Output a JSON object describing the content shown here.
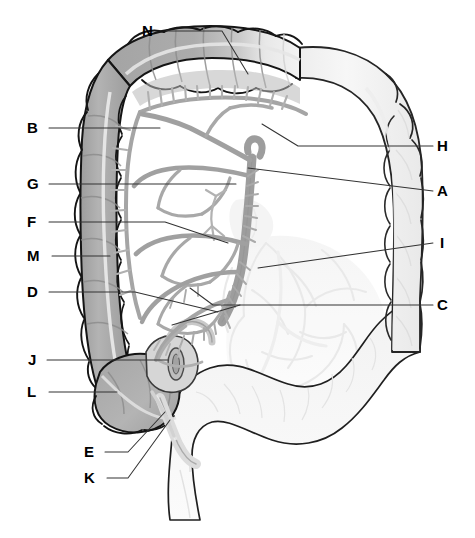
{
  "figure": {
    "background_color": "#ffffff",
    "width": 475,
    "height": 538
  },
  "palette": {
    "outline": "#1a1a1a",
    "near_colon_fill": "#ababab",
    "near_colon_fill_dark": "#9a9a9a",
    "far_colon_fill": "#f1f1f1",
    "far_colon_outline": "#2b2b2b",
    "vessel": "#9d9d9d",
    "vessel_light": "#b5b5b5",
    "ghost_vessel": "#e4e4e4",
    "ghost_organ": "#f2f2f2",
    "leader_line": "#333333",
    "label_text": "#000000",
    "taenia": "#e9e9e9"
  },
  "labels": [
    {
      "id": "N",
      "text": "N",
      "side": "top",
      "x": 142,
      "y": 23,
      "anchor": [
        166,
        31
      ],
      "path": [
        [
          166,
          31
        ],
        [
          222,
          31
        ],
        [
          248,
          74
        ]
      ],
      "target_part": "transverse-colon"
    },
    {
      "id": "B",
      "text": "B",
      "side": "left",
      "x": 27,
      "y": 120,
      "anchor": [
        49,
        128
      ],
      "path": [
        [
          49,
          128
        ],
        [
          160,
          128
        ]
      ],
      "target_part": "middle-colic-artery"
    },
    {
      "id": "H",
      "text": "H",
      "side": "right",
      "x": 437,
      "y": 138,
      "anchor": [
        433,
        146
      ],
      "path": [
        [
          433,
          146
        ],
        [
          298,
          146
        ],
        [
          262,
          124
        ]
      ],
      "target_part": "marginal-artery"
    },
    {
      "id": "G",
      "text": "G",
      "side": "left",
      "x": 27,
      "y": 176,
      "anchor": [
        49,
        184
      ],
      "path": [
        [
          49,
          184
        ],
        [
          236,
          184
        ]
      ],
      "target_part": "jejunal-arteries"
    },
    {
      "id": "A",
      "text": "A",
      "side": "right",
      "x": 437,
      "y": 183,
      "anchor": [
        433,
        191
      ],
      "path": [
        [
          433,
          191
        ],
        [
          248,
          168
        ]
      ],
      "target_part": "superior-mesenteric-artery"
    },
    {
      "id": "F",
      "text": "F",
      "side": "left",
      "x": 27,
      "y": 214,
      "anchor": [
        49,
        222
      ],
      "path": [
        [
          49,
          222
        ],
        [
          165,
          222
        ],
        [
          228,
          243
        ]
      ],
      "target_part": "ileocolic-artery"
    },
    {
      "id": "M",
      "text": "M",
      "side": "left",
      "x": 27,
      "y": 248,
      "anchor": [
        52,
        256
      ],
      "path": [
        [
          52,
          256
        ],
        [
          110,
          256
        ]
      ],
      "target_part": "ascending-colon"
    },
    {
      "id": "I",
      "text": "I",
      "side": "right",
      "x": 440,
      "y": 235,
      "anchor": [
        433,
        243
      ],
      "path": [
        [
          433,
          243
        ],
        [
          258,
          268
        ]
      ],
      "target_part": "mesentery"
    },
    {
      "id": "D",
      "text": "D",
      "side": "left",
      "x": 27,
      "y": 284,
      "anchor": [
        49,
        292
      ],
      "path": [
        [
          49,
          292
        ],
        [
          135,
          292
        ],
        [
          218,
          312
        ]
      ],
      "target_part": "ileal-arteries"
    },
    {
      "id": "C",
      "text": "C",
      "side": "right",
      "x": 437,
      "y": 297,
      "anchor": [
        433,
        305
      ],
      "path": [
        [
          433,
          305
        ],
        [
          213,
          305
        ],
        [
          190,
          288
        ]
      ],
      "path2": [
        [
          240,
          305
        ],
        [
          172,
          325
        ]
      ],
      "target_part": "vasa-recta-straight-arteries"
    },
    {
      "id": "J",
      "text": "J",
      "side": "left",
      "x": 28,
      "y": 352,
      "anchor": [
        47,
        360
      ],
      "path": [
        [
          47,
          360
        ],
        [
          168,
          360
        ]
      ],
      "target_part": "ileocecal-junction"
    },
    {
      "id": "L",
      "text": "L",
      "side": "left",
      "x": 27,
      "y": 384,
      "anchor": [
        49,
        392
      ],
      "path": [
        [
          49,
          392
        ],
        [
          117,
          392
        ]
      ],
      "target_part": "cecum"
    },
    {
      "id": "E",
      "text": "E",
      "side": "bottom",
      "x": 84,
      "y": 444,
      "anchor": [
        105,
        452
      ],
      "path": [
        [
          105,
          452
        ],
        [
          128,
          452
        ],
        [
          165,
          412
        ]
      ],
      "target_part": "appendicular-artery"
    },
    {
      "id": "K",
      "text": "K",
      "side": "bottom",
      "x": 84,
      "y": 470,
      "anchor": [
        107,
        478
      ],
      "path": [
        [
          107,
          478
        ],
        [
          128,
          478
        ],
        [
          170,
          420
        ]
      ],
      "target_part": "vermiform-appendix"
    }
  ],
  "structures": {
    "transverse_colon": "transverse colon (shaded, upper horizontal segment)",
    "ascending_colon": "ascending colon (shaded, left vertical segment)",
    "descending_colon": "descending colon (pale, right vertical segment)",
    "sigmoid_colon": "sigmoid colon (pale, lower curve)",
    "cecum": "cecum (shaded, lower-left pouch)",
    "appendix": "vermiform appendix (small pale tube below cecum)",
    "sma": "superior mesenteric artery trunk (central vertical vessel)",
    "arcades": "arterial arcades / loops in mesentery",
    "vasa_recta": "vasa recta (short straight terminal arteries)",
    "ghost_layer": "faded background vasculature and organ silhouettes"
  }
}
